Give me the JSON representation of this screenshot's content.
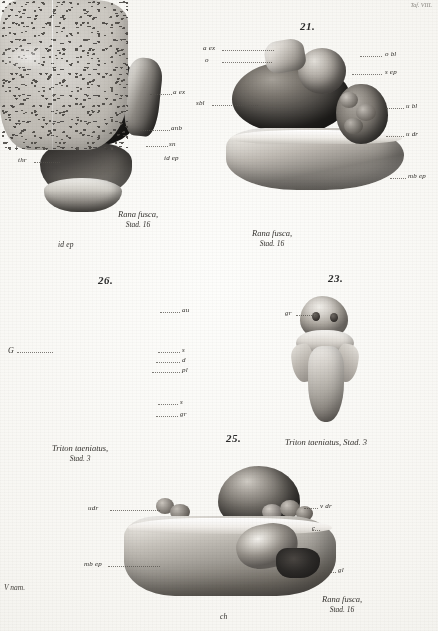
{
  "plate": {
    "corner_note": "Taf. VIII.",
    "margin_note": "V nam.",
    "background_hex": "#f7f6f2",
    "ink_hex": "#2e2c28"
  },
  "figures": [
    {
      "id": "fig20",
      "number": "20.",
      "caption_line1": "Rana fusca,",
      "caption_line2": "Stad. 16",
      "below_label": "id ep",
      "labels": [
        {
          "key": "s-ep",
          "text": "s ep"
        },
        {
          "key": "o-bl",
          "text": "o bl"
        },
        {
          "key": "o-dr",
          "text": "o dr"
        },
        {
          "key": "la",
          "text": "l a"
        },
        {
          "key": "vt",
          "text": "v t"
        },
        {
          "key": "r-dr",
          "text": "r dr"
        },
        {
          "key": "thr",
          "text": "thr"
        },
        {
          "key": "a-ex",
          "text": "a ex"
        },
        {
          "key": "anb",
          "text": "anb"
        },
        {
          "key": "sn",
          "text": "sn"
        },
        {
          "key": "id-ep",
          "text": "id ep"
        }
      ]
    },
    {
      "id": "fig21",
      "number": "21.",
      "caption_line1": "Rana fusca,",
      "caption_line2": "Stad. 16",
      "labels": [
        {
          "key": "a-ex",
          "text": "a ex"
        },
        {
          "key": "o",
          "text": "o"
        },
        {
          "key": "sbl",
          "text": "sbl"
        },
        {
          "key": "o-bl",
          "text": "o bl"
        },
        {
          "key": "s-ep",
          "text": "s ep"
        },
        {
          "key": "u-bl",
          "text": "u bl"
        },
        {
          "key": "u-dr",
          "text": "u dr"
        },
        {
          "key": "mb-ep",
          "text": "mb ep"
        }
      ]
    },
    {
      "id": "fig26",
      "number": "26.",
      "caption_line1": "Triton taeniatus,",
      "caption_line2": "Stad. 3",
      "labels": [
        {
          "key": "G",
          "text": "G"
        },
        {
          "key": "au",
          "text": "au"
        },
        {
          "key": "s",
          "text": "s"
        },
        {
          "key": "d",
          "text": "d"
        },
        {
          "key": "pl",
          "text": "pl"
        },
        {
          "key": "s2",
          "text": "s"
        },
        {
          "key": "gr",
          "text": "gr"
        }
      ]
    },
    {
      "id": "fig23",
      "number": "23.",
      "caption_line1": "Triton taeniatus, Stad. 3",
      "caption_line2": "",
      "labels": [
        {
          "key": "gr",
          "text": "gr"
        }
      ]
    },
    {
      "id": "fig25",
      "number": "25.",
      "caption_line1": "Rana fusca,",
      "caption_line2": "Stad. 16",
      "below_label": "ch",
      "labels": [
        {
          "key": "udr",
          "text": "udr"
        },
        {
          "key": "mb-ep",
          "text": "mb ep"
        },
        {
          "key": "v-dr",
          "text": "v dr"
        },
        {
          "key": "c",
          "text": "c"
        },
        {
          "key": "gl",
          "text": "gl"
        }
      ]
    }
  ]
}
